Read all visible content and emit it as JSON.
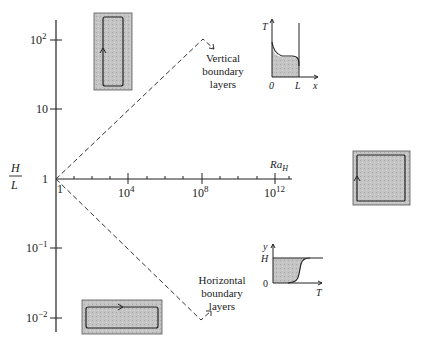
{
  "diagram": {
    "type": "regime-diagram",
    "y_axis": {
      "label_numerator": "H",
      "label_denominator": "L",
      "ticks": [
        {
          "base": "10",
          "exp": "2",
          "y": 40
        },
        {
          "base": "10",
          "exp": "",
          "y": 109
        },
        {
          "base": "1",
          "exp": "",
          "y": 179
        },
        {
          "base": "10",
          "exp": "−1",
          "y": 248
        },
        {
          "base": "10",
          "exp": "−2",
          "y": 318
        }
      ]
    },
    "x_axis": {
      "label": "Ra",
      "label_sub": "H",
      "origin_label": "1",
      "ticks": [
        {
          "base": "10",
          "exp": "4",
          "x": 128
        },
        {
          "base": "10",
          "exp": "8",
          "x": 202
        },
        {
          "base": "10",
          "exp": "12",
          "x": 275
        }
      ]
    },
    "annotations": {
      "vertical": [
        "Vertical",
        "boundary",
        "layers"
      ],
      "horizontal": [
        "Horizontal",
        "boundary",
        "layers"
      ]
    },
    "inset_vertical_profile": {
      "y_label": "T",
      "x_label": "x",
      "x_start": "0",
      "x_end": "L"
    },
    "inset_horizontal_profile": {
      "y_label": "y",
      "y_top": "H",
      "y_bottom": "0",
      "x_label": "T"
    },
    "enclosures": [
      "tall-enclosure",
      "square-enclosure",
      "shallow-enclosure"
    ],
    "colors": {
      "ink": "#222222",
      "fill_gray": "#b8b8b8",
      "fill_gray_light": "#cfcfcf"
    }
  }
}
